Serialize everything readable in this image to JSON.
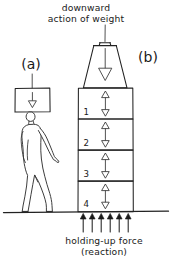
{
  "figure": {
    "title_top_line1": "downward",
    "title_top_line2": "action of weight",
    "caption_bottom_line1": "holding-up force",
    "caption_bottom_line2": "(reaction)",
    "label_a": "(a)",
    "label_b": "(b)",
    "ink_color": "#222222",
    "paper_color": "#ffffff"
  },
  "panel_a": {
    "label": "(a)",
    "load_box": {
      "arrow_direction": "down",
      "x": 15,
      "y": 88,
      "width": 35,
      "height": 24
    },
    "pointer_line": {
      "x": 32,
      "y1": 74,
      "y2": 88
    },
    "person": {
      "description": "walking person carrying load on head"
    }
  },
  "panel_b": {
    "label": "(b)",
    "weight": {
      "shape": "trapezoid",
      "arrow_direction": "down",
      "top_width": 22,
      "bottom_width": 44,
      "top_y": 43,
      "bottom_y": 88
    },
    "weight_pointer_line": {
      "x": 105,
      "y1": 20,
      "y2": 40
    },
    "blocks": [
      {
        "number": "1",
        "top": 88,
        "bottom": 119
      },
      {
        "number": "2",
        "top": 119,
        "bottom": 150
      },
      {
        "number": "3",
        "top": 150,
        "bottom": 181
      },
      {
        "number": "4",
        "top": 181,
        "bottom": 212
      }
    ],
    "block_left": 78,
    "block_right": 133,
    "internal_arrows": {
      "count_per_block": 2,
      "directions": [
        "up",
        "down"
      ],
      "style": "hollow-triangle"
    },
    "reaction_arrows": {
      "count": 6,
      "direction": "up",
      "style": "solid",
      "x_positions": [
        83,
        92,
        101,
        110,
        119,
        128
      ],
      "tail_y": 232,
      "head_y": 214
    }
  },
  "ground": {
    "y": 212,
    "x_start": 3,
    "x_end": 169
  }
}
